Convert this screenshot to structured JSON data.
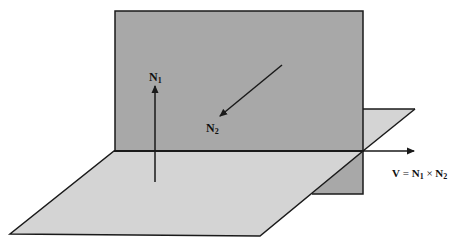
{
  "diagram": {
    "colors": {
      "vertical_plane": "#a8a8a8",
      "horizontal_plane": "#d4d4d4",
      "stroke": "#1a1a1a",
      "background": "#ffffff"
    },
    "labels": {
      "n1": {
        "main": "N",
        "sub": "1"
      },
      "n2": {
        "main": "N",
        "sub": "2"
      },
      "v": {
        "lhs": "V",
        "eq": " = ",
        "n1_main": "N",
        "n1_sub": "1",
        "times": " × ",
        "n2_main": "N",
        "n2_sub": "2"
      }
    },
    "elements": [
      "vertical plane (darker gray rectangle)",
      "horizontal plane (lighter gray parallelogram)",
      "intersection line",
      "normal vector N1 (vertical arrow)",
      "normal vector N2 (diagonal arrow into vertical plane)",
      "direction vector V = N1 × N2 along intersection line"
    ]
  }
}
